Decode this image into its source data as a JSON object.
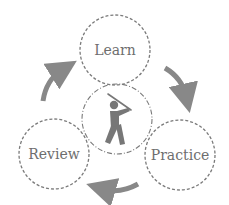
{
  "diagram": {
    "type": "cycle",
    "center_icon": "golfer-swing-icon",
    "stages": [
      {
        "label": "Learn"
      },
      {
        "label": "Practice"
      },
      {
        "label": "Review"
      }
    ],
    "flow": [
      "Learn → Practice",
      "Practice → Review",
      "Review → Learn"
    ],
    "colors": {
      "stroke": "#7a7a7a",
      "arrow": "#888888",
      "icon": "#777777",
      "text": "#6e6e6e"
    }
  }
}
